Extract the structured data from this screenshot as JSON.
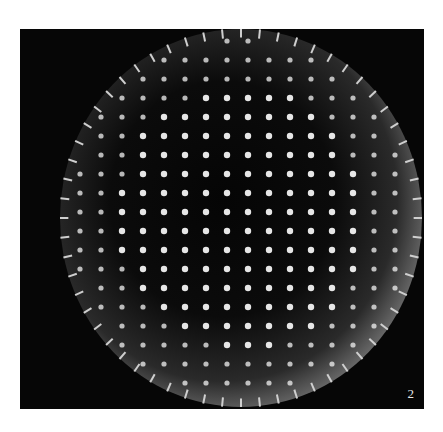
{
  "figure": {
    "panel_label": "2",
    "colors": {
      "background": "#ffffff",
      "frame": "#060606",
      "highlight": "#e0e0e0"
    }
  }
}
